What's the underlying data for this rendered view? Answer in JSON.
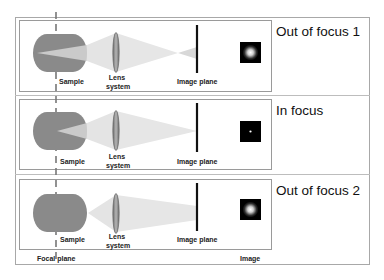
{
  "panels": [
    {
      "state_label": "Out of focus 1",
      "sample_label": "Sample",
      "lens_label_line1": "Lens",
      "lens_label_line2": "system",
      "image_plane_label": "Image plane",
      "image_type": "blurred-spot"
    },
    {
      "state_label": "In focus",
      "sample_label": "Sample",
      "lens_label_line1": "Lens",
      "lens_label_line2": "system",
      "image_plane_label": "Image plane",
      "image_type": "sharp-point"
    },
    {
      "state_label": "Out of focus 2",
      "sample_label": "Sample",
      "lens_label_line1": "Lens",
      "lens_label_line2": "system",
      "image_plane_label": "Image plane",
      "image_type": "blurred-spot"
    }
  ],
  "footer": {
    "focal_plane_label": "Focal plane",
    "image_label": "Image"
  },
  "colors": {
    "sample_fill": "#8a8a8a",
    "cone_fill": "#d9d9d9",
    "lens_fill": "#9a9a9a",
    "image_plane": "#111111",
    "image_bg": "#000000"
  }
}
